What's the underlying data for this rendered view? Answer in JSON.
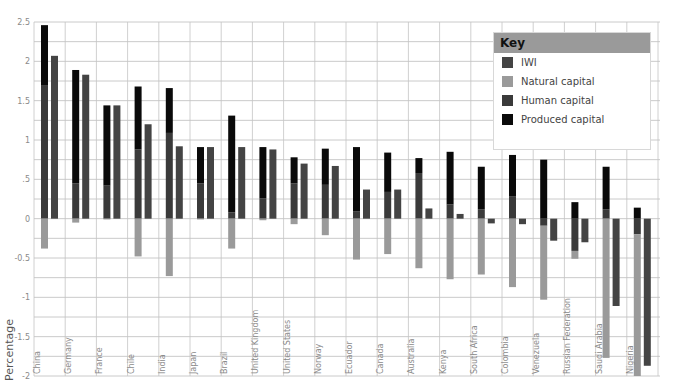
{
  "chart_data": {
    "type": "bar",
    "title": "",
    "xlabel": "",
    "ylabel": "Percentage",
    "ylim": [
      -2,
      2.5
    ],
    "yticks": [
      2.5,
      2,
      1.5,
      1,
      0.5,
      0,
      -0.5,
      -1,
      -1.5,
      -2
    ],
    "ytick_labels": [
      "2.5",
      "2",
      "1.5",
      "1",
      ".5",
      "0",
      "-0.5",
      "-1",
      "-1.5",
      "-2"
    ],
    "grid": true,
    "legend_position": "top-right",
    "legend_title": "Key",
    "categories": [
      "China",
      "Germany",
      "France",
      "Chile",
      "India",
      "Japan",
      "Brazil",
      "United Kingdom",
      "United States",
      "Norway",
      "Ecuador",
      "Canada",
      "Australia",
      "Kenya",
      "South Africa",
      "Colombia",
      "Venezuela",
      "Russian Federation",
      "Saudi Arabia",
      "Nigeria"
    ],
    "series": [
      {
        "name": "IWI",
        "color": "#444444",
        "stack": "iwi",
        "values": [
          2.07,
          1.83,
          1.44,
          1.2,
          0.92,
          0.91,
          0.91,
          0.88,
          0.7,
          0.67,
          0.37,
          0.37,
          0.13,
          0.06,
          -0.06,
          -0.07,
          -0.28,
          -0.3,
          -1.11,
          -1.87
        ]
      },
      {
        "name": "Natural capital",
        "color": "#9a9a9a",
        "stack": "components",
        "values": [
          -0.38,
          -0.05,
          -0.01,
          -0.48,
          -0.73,
          -0.01,
          -0.38,
          -0.02,
          -0.07,
          -0.21,
          -0.52,
          -0.45,
          -0.63,
          -0.77,
          -0.71,
          -0.87,
          -0.94,
          -0.1,
          -1.77,
          -1.85
        ]
      },
      {
        "name": "Human capital",
        "color": "#3a3a3a",
        "stack": "components",
        "values": [
          1.69,
          0.45,
          0.42,
          0.88,
          1.09,
          0.45,
          0.08,
          0.26,
          0.45,
          0.43,
          0.09,
          0.34,
          0.58,
          0.18,
          0.12,
          0.28,
          -0.09,
          -0.41,
          0.12,
          -0.2
        ]
      },
      {
        "name": "Produced capital",
        "color": "#0a0a0a",
        "stack": "components",
        "values": [
          0.77,
          1.44,
          1.02,
          0.8,
          0.57,
          0.46,
          1.23,
          0.65,
          0.33,
          0.46,
          0.82,
          0.5,
          0.19,
          0.67,
          0.54,
          0.53,
          0.75,
          0.21,
          0.54,
          0.14
        ]
      }
    ]
  },
  "legend": {
    "title": "Key",
    "items": [
      {
        "label": "IWI",
        "color": "#444444"
      },
      {
        "label": "Natural capital",
        "color": "#9a9a9a"
      },
      {
        "label": "Human capital",
        "color": "#3a3a3a"
      },
      {
        "label": "Produced capital",
        "color": "#0a0a0a"
      }
    ]
  },
  "axis": {
    "ylabel": "Percentage"
  }
}
